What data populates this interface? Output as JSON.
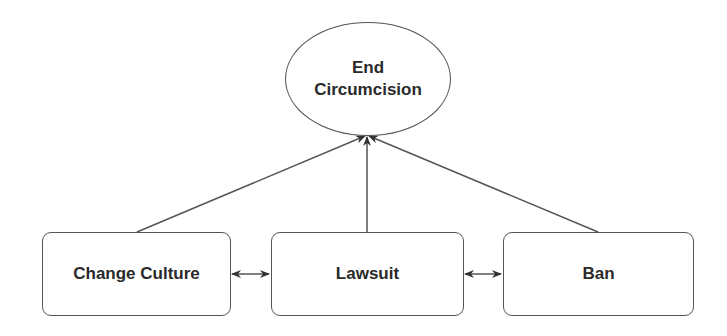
{
  "diagram": {
    "goal": {
      "id": "goal",
      "label_line1": "End",
      "label_line2": "Circumcision"
    },
    "nodes": [
      {
        "id": "change-culture",
        "label": "Change Culture"
      },
      {
        "id": "lawsuit",
        "label": "Lawsuit"
      },
      {
        "id": "ban",
        "label": "Ban"
      }
    ],
    "edges": [
      {
        "from": "change-culture",
        "to": "goal",
        "type": "directed"
      },
      {
        "from": "lawsuit",
        "to": "goal",
        "type": "directed"
      },
      {
        "from": "ban",
        "to": "goal",
        "type": "directed"
      },
      {
        "from": "change-culture",
        "to": "lawsuit",
        "type": "bidirectional"
      },
      {
        "from": "lawsuit",
        "to": "ban",
        "type": "bidirectional"
      }
    ],
    "colors": {
      "stroke": "#555555",
      "text": "#2a2a2a",
      "background": "#ffffff"
    }
  }
}
